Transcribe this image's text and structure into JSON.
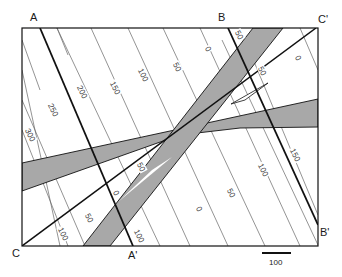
{
  "figure": {
    "type": "geologic-map-cross-section-lines",
    "frame": {
      "x1": 22,
      "y1": 28,
      "x2": 318,
      "y2": 246
    },
    "colors": {
      "band_fill": "#a8a8a8",
      "line": "#111111",
      "contour": "#666666",
      "background": "#ffffff"
    }
  },
  "section_lines": {
    "A": {
      "label": "A",
      "end_label": "A'"
    },
    "B": {
      "label": "B",
      "end_label": "B'"
    },
    "C": {
      "label": "C",
      "end_label": "C'"
    }
  },
  "contour_labels": [
    {
      "text": "300",
      "x": 30,
      "y": 135,
      "rot": 62
    },
    {
      "text": "250",
      "x": 53,
      "y": 110,
      "rot": 62
    },
    {
      "text": "200",
      "x": 82,
      "y": 92,
      "rot": 62
    },
    {
      "text": "150",
      "x": 115,
      "y": 88,
      "rot": 62
    },
    {
      "text": "100",
      "x": 143,
      "y": 75,
      "rot": 62
    },
    {
      "text": "50",
      "x": 177,
      "y": 67,
      "rot": 62
    },
    {
      "text": "0",
      "x": 208,
      "y": 49,
      "rot": 62
    },
    {
      "text": "50",
      "x": 239,
      "y": 35,
      "rot": 62
    },
    {
      "text": "50",
      "x": 262,
      "y": 71,
      "rot": 62
    },
    {
      "text": "0",
      "x": 298,
      "y": 58,
      "rot": 62
    },
    {
      "text": "150",
      "x": 295,
      "y": 155,
      "rot": 62
    },
    {
      "text": "100",
      "x": 263,
      "y": 170,
      "rot": 62
    },
    {
      "text": "50",
      "x": 231,
      "y": 193,
      "rot": 62
    },
    {
      "text": "0",
      "x": 199,
      "y": 209,
      "rot": 62
    },
    {
      "text": "50",
      "x": 141,
      "y": 167,
      "rot": 62
    },
    {
      "text": "0",
      "x": 116,
      "y": 193,
      "rot": 62
    },
    {
      "text": "50",
      "x": 89,
      "y": 218,
      "rot": 62
    },
    {
      "text": "100",
      "x": 63,
      "y": 234,
      "rot": 62
    },
    {
      "text": "100",
      "x": 139,
      "y": 236,
      "rot": 62
    }
  ],
  "scale_bar": {
    "label": "100"
  }
}
